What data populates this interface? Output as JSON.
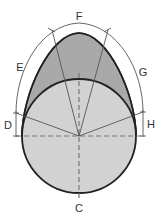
{
  "labels": {
    "top": "F",
    "upper_left": "E",
    "upper_right": "G",
    "left": "D",
    "right": "H",
    "bottom": "C"
  },
  "colors": {
    "upper_egg_fill": "#a9a9a9",
    "circle_fill": "#d2d2d2",
    "outline": "#222222",
    "dim_line": "#555555",
    "dashed": "#777777"
  }
}
